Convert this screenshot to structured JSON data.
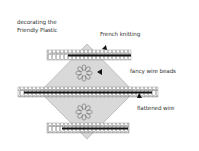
{
  "diagram": {
    "labels": {
      "decorating_line1": "decorating the",
      "decorating_line2": "Friendly Plastic",
      "french_knitting": "French knitting",
      "fancy_wire_beads": "fancy wire beads",
      "flattened_wire": "flattened wire"
    },
    "colors": {
      "diamond_fill": "#d9d9d9",
      "diamond_stroke": "#b5b5b5",
      "wire_dark": "#111111",
      "bead_stroke": "#777777",
      "text": "#333333"
    },
    "icons": {
      "flower": "flower-outline",
      "arrow": "arrowhead-pointer"
    }
  }
}
